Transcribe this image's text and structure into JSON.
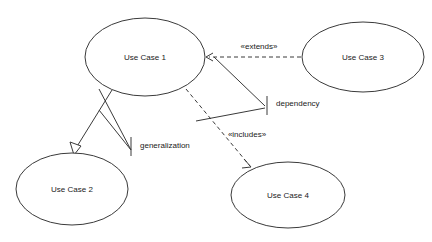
{
  "diagram": {
    "type": "uml-use-case-diagram",
    "canvas": {
      "width": 432,
      "height": 242,
      "background": "#ffffff"
    },
    "stroke_color": "#3a3a3a",
    "text_color": "#1a1a1a",
    "nodes": [
      {
        "id": "uc1",
        "label": "Use Case 1",
        "cx": 145,
        "cy": 57,
        "rx": 60,
        "ry": 39
      },
      {
        "id": "uc3",
        "label": "Use Case 3",
        "cx": 363,
        "cy": 57,
        "rx": 61,
        "ry": 35
      },
      {
        "id": "uc2",
        "label": "Use Case 2",
        "cx": 72,
        "cy": 189,
        "rx": 56,
        "ry": 36
      },
      {
        "id": "uc4",
        "label": "Use Case 4",
        "cx": 288,
        "cy": 195,
        "rx": 57,
        "ry": 33
      }
    ],
    "relationships": [
      {
        "id": "extends",
        "label": "«extends»",
        "style": "dashed",
        "arrow": "open",
        "from": "uc3",
        "to": "uc1",
        "label_x": 259,
        "label_y": 47
      },
      {
        "id": "includes",
        "label": "«includes»",
        "style": "dashed",
        "arrow": "open",
        "from": "uc1",
        "to": "uc4",
        "label_x": 247,
        "label_y": 135
      },
      {
        "id": "generalization",
        "label": "",
        "style": "solid",
        "arrow": "hollow-triangle",
        "from": "uc1",
        "to": "uc2"
      }
    ],
    "annotations": [
      {
        "id": "dependency",
        "label": "dependency",
        "x": 276,
        "y": 104
      },
      {
        "id": "generalization",
        "label": "generalization",
        "x": 140,
        "y": 146
      }
    ]
  }
}
